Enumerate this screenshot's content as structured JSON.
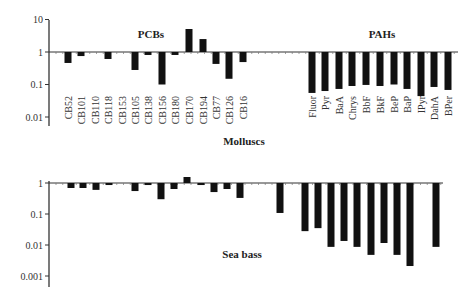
{
  "chart_data": [
    {
      "type": "bar",
      "title": "Molluscs",
      "yscale": "log",
      "ylim": [
        0.01,
        10
      ],
      "yticks": [
        "10",
        "1",
        "0.1",
        "0.01"
      ],
      "baseline": 1,
      "group_labels": [
        "PCBs",
        "PAHs"
      ],
      "categories": [
        "CB52",
        "CB101",
        "CB110",
        "CB118",
        "CB153",
        "CB105",
        "CB138",
        "CB156",
        "CB180",
        "CB170",
        "CB194",
        "CB77",
        "CB126",
        "CB16",
        "Fluor",
        "Pyr",
        "BaA",
        "Chrys",
        "BbF",
        "BkF",
        "BeP",
        "BaP",
        "IPyr",
        "DahA",
        "BPer"
      ],
      "values": [
        0.46,
        0.75,
        0.98,
        0.61,
        1.0,
        0.28,
        0.81,
        0.1,
        0.81,
        5.1,
        2.5,
        0.43,
        0.15,
        0.49,
        0.055,
        0.063,
        0.073,
        0.09,
        0.097,
        0.09,
        0.1,
        0.073,
        0.044,
        0.084,
        0.068
      ],
      "xlabel": "",
      "ylabel": "",
      "grid": false
    },
    {
      "type": "bar",
      "title": "Sea bass",
      "yscale": "log",
      "ylim": [
        0.001,
        1
      ],
      "yticks": [
        "1",
        "0.1",
        "0.01",
        "0.001"
      ],
      "baseline": 1,
      "categories": [
        "CB52",
        "CB101",
        "CB110",
        "CB118",
        "CB153",
        "CB105",
        "CB138",
        "CB156",
        "CB180",
        "CB170",
        "CB194",
        "CB77",
        "CB126",
        "CB16",
        "Fluor",
        "Pyr",
        "BaA",
        "Chrys",
        "BbF",
        "BkF",
        "BeP",
        "BaP",
        "IPyr",
        "DahA",
        "BPer"
      ],
      "values": [
        0.69,
        0.69,
        0.6,
        0.86,
        1.0,
        0.55,
        0.86,
        0.3,
        0.64,
        1.56,
        0.86,
        0.51,
        0.64,
        0.33,
        0.108,
        0.028,
        0.035,
        0.0087,
        0.0135,
        0.0087,
        0.0048,
        0.0116,
        0.0048,
        0.0021,
        0.0087
      ],
      "xlabel": "",
      "ylabel": "",
      "grid": false
    }
  ],
  "labels": {
    "molluscs": "Molluscs",
    "sea_bass": "Sea bass",
    "pcbs": "PCBs",
    "pahs": "PAHs"
  },
  "colors": {
    "bar": "#111111",
    "axis": "#333333"
  }
}
